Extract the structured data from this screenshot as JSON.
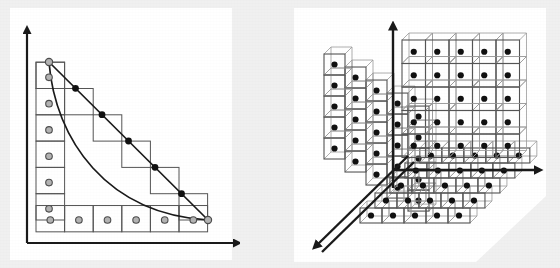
{
  "figure": {
    "background_color": "#f0f0f0",
    "panel_background_color": "#ffffff",
    "line_color": "#1a1a1a",
    "cell_stroke_color": "#555555",
    "open_marker_fill": "#b3b3b3",
    "open_marker_stroke": "#4d4d4d",
    "filled_marker_fill": "#111111"
  },
  "panels": [
    {
      "id": "left",
      "name": "staircase-panel",
      "label": "2D staircase approximation",
      "axes": {
        "vertical_axis": {
          "name": "y-axis",
          "arrow": "up",
          "x": 27,
          "y_top": 30,
          "y_bottom": 243
        },
        "horizontal_axis": {
          "name": "x-axis",
          "arrow": "right",
          "y": 243,
          "x_left": 27,
          "x_right": 237
        }
      },
      "grid": {
        "columns": 6,
        "rows": 6,
        "origin_x": 36,
        "origin_y": 220,
        "cell_width": 28.6,
        "cell_height": 26.3
      },
      "staircase_steps": 6,
      "chord_line": {
        "from": [
          49,
          62
        ],
        "to": [
          208,
          220
        ]
      },
      "curve": {
        "type": "convex-decay",
        "from": [
          49,
          62
        ],
        "to": [
          208,
          220
        ]
      },
      "markers": {
        "open_circles_vertical": 6,
        "open_circles_horizontal": 6,
        "filled_dots_on_chord": 5
      }
    },
    {
      "id": "right",
      "name": "cube-lattice-panel",
      "label": "3D three-plane cube lattice",
      "axes": {
        "vertical_axis": {
          "name": "z-axis",
          "arrow": "up"
        },
        "horizontal_axis": {
          "name": "x-axis",
          "arrow": "right"
        },
        "depth_axis": {
          "name": "y-axis",
          "arrow": "down-left-diagonal"
        }
      },
      "planes": [
        {
          "name": "front-plane",
          "orientation": "xz",
          "rows": 5,
          "cols": 5,
          "dots_per_cube": 1
        },
        {
          "name": "left-plane",
          "orientation": "yz",
          "rows": 5,
          "cols": 5,
          "dots_per_cube": 1
        },
        {
          "name": "bottom-plane",
          "orientation": "xy",
          "rows": 5,
          "cols": 5,
          "dots_per_cube": 1
        }
      ],
      "cube_depth": 7,
      "total_cubes": 75
    }
  ]
}
